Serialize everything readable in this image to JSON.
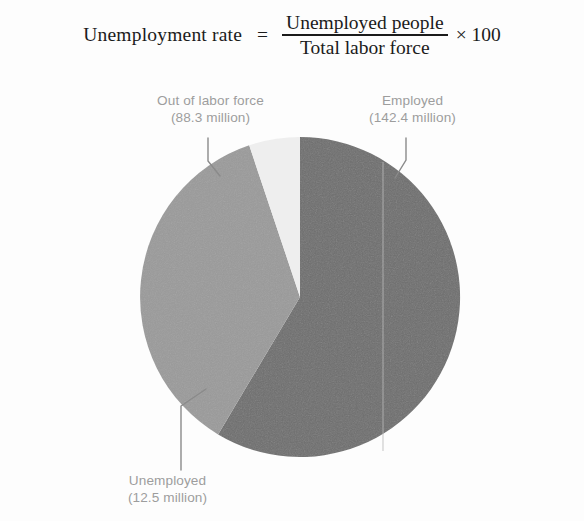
{
  "formula": {
    "lhs": "Unemployment rate",
    "equals": "=",
    "numerator": "Unemployed people",
    "denominator": "Total labor force",
    "multiplier": "× 100"
  },
  "labels": {
    "out_of_labor_force": {
      "name": "Out of labor force",
      "value": "(88.3 million)"
    },
    "employed": {
      "name": "Employed",
      "value": "(142.4 million)"
    },
    "unemployed": {
      "name": "Unemployed",
      "value": "(12.5 million)"
    }
  },
  "colors": {
    "employed": "#6e6e6e",
    "out_of_labor_force": "#9a9a9a",
    "unemployed": "#eeeeee",
    "label_text": "#9d9d9d",
    "leader_line": "#8a8a8a",
    "formula_text": "#1b1b1b",
    "background": "#fdfdfd"
  },
  "chart_data": {
    "type": "pie",
    "title": "",
    "unit": "million people",
    "categories": [
      "Employed",
      "Out of labor force",
      "Unemployed"
    ],
    "values": [
      142.4,
      88.3,
      12.5
    ],
    "labels": [
      "Employed (142.4 million)",
      "Out of labor force (88.3 million)",
      "Unemployed (12.5 million)"
    ],
    "colors": [
      "#6e6e6e",
      "#9a9a9a",
      "#eeeeee"
    ],
    "percentages": [
      58.6,
      36.3,
      5.1
    ],
    "total": 243.2,
    "start_angle_deg": 0,
    "direction": "clockwise",
    "legend": "none",
    "annotations": [
      "Unemployment rate = Unemployed people / Total labor force × 100"
    ]
  }
}
